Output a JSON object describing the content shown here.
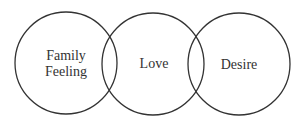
{
  "diagram": {
    "type": "venn",
    "circles": [
      {
        "id": "family-feeling",
        "label_lines": [
          "Family",
          "Feeling"
        ],
        "cx": 66,
        "cy": 63,
        "r": 51
      },
      {
        "id": "love",
        "label_lines": [
          "Love"
        ],
        "cx": 153,
        "cy": 64,
        "r": 51
      },
      {
        "id": "desire",
        "label_lines": [
          "Desire"
        ],
        "cx": 239,
        "cy": 64,
        "r": 51
      }
    ],
    "stroke_color": "#333333",
    "text_color": "#333333"
  }
}
